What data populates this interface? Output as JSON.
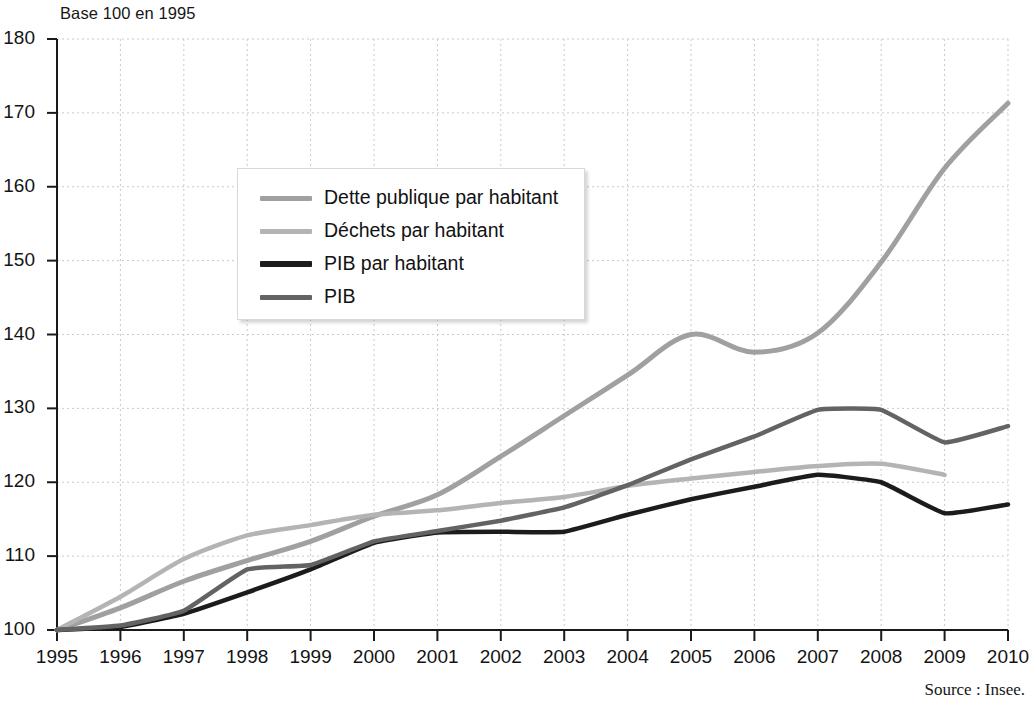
{
  "figure": {
    "axis_title": "Base 100 en 1995",
    "source": "Source : Insee."
  },
  "chart_data": {
    "type": "line",
    "title": "Base 100 en 1995",
    "xlabel": "",
    "ylabel": "Base 100 en 1995",
    "xlim": [
      1995,
      2010
    ],
    "ylim": [
      100,
      180
    ],
    "ytick_step": 10,
    "grid": true,
    "legend_position": "upper-left-inside",
    "x": [
      1995,
      1996,
      1997,
      1998,
      1999,
      2000,
      2001,
      2002,
      2003,
      2004,
      2005,
      2006,
      2007,
      2008,
      2009,
      2010
    ],
    "xticklabels": [
      "1995",
      "1996",
      "1997",
      "1998",
      "1999",
      "2000",
      "2001",
      "2002",
      "2003",
      "2004",
      "2005",
      "2006",
      "2007",
      "2008",
      "2009",
      "2010"
    ],
    "yticklabels": [
      "100",
      "110",
      "120",
      "130",
      "140",
      "150",
      "160",
      "170",
      "180"
    ],
    "yticks": [
      100,
      110,
      120,
      130,
      140,
      150,
      160,
      170,
      180
    ],
    "series": [
      {
        "name": "Dette publique par habitant",
        "color": "#a0a0a0",
        "width": 5,
        "values": [
          100.0,
          103.0,
          106.6,
          109.4,
          112.0,
          115.4,
          118.3,
          123.5,
          129.0,
          134.5,
          140.0,
          137.6,
          140.2,
          149.8,
          162.5,
          171.3
        ]
      },
      {
        "name": "Déchets par habitant",
        "color": "#b4b4b4",
        "width": 4.5,
        "values": [
          100.0,
          104.5,
          109.6,
          112.8,
          114.2,
          115.6,
          116.2,
          117.2,
          118.0,
          119.5,
          120.5,
          121.4,
          122.2,
          122.5,
          121.0,
          null
        ]
      },
      {
        "name": "PIB par habitant",
        "color": "#1c1c1c",
        "width": 4.5,
        "values": [
          100.0,
          100.4,
          102.2,
          105.1,
          108.2,
          111.8,
          113.2,
          113.3,
          113.3,
          115.6,
          117.7,
          119.4,
          121.0,
          120.0,
          115.8,
          117.0
        ]
      },
      {
        "name": "PIB",
        "color": "#636363",
        "width": 4.5,
        "values": [
          100.0,
          100.6,
          102.6,
          108.2,
          108.8,
          112.0,
          113.4,
          114.8,
          116.6,
          119.6,
          123.1,
          126.2,
          129.8,
          129.8,
          125.4,
          127.6
        ]
      }
    ]
  },
  "legend": {
    "items": [
      {
        "label": "Dette publique par habitant",
        "color": "#a0a0a0"
      },
      {
        "label": "Déchets par habitant",
        "color": "#b4b4b4"
      },
      {
        "label": "PIB par habitant",
        "color": "#1c1c1c"
      },
      {
        "label": "PIB",
        "color": "#636363"
      }
    ]
  }
}
